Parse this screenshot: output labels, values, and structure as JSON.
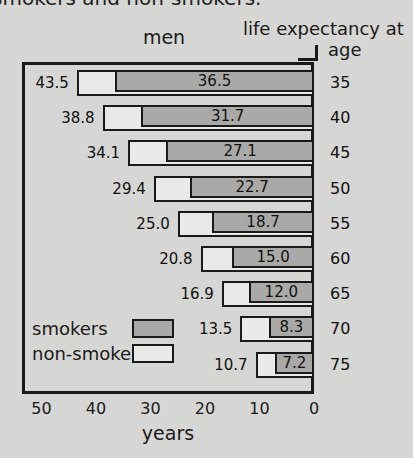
{
  "caption": {
    "text": "smokers and non-smokers."
  },
  "header": {
    "group_label": "men",
    "right_label_line1": "life expectancy at",
    "right_label_line2": "age"
  },
  "legend": {
    "items": [
      {
        "label": "smokers",
        "swatch": "gray",
        "color": "#a9a9a7"
      },
      {
        "label": "non-smokers",
        "swatch": "white",
        "color": "#e9e9e7"
      }
    ]
  },
  "axis": {
    "x_title": "years",
    "x_ticks": [
      "50",
      "40",
      "30",
      "20",
      "10",
      "0"
    ]
  },
  "chart_data": {
    "type": "bar",
    "orientation": "horizontal",
    "title": "men",
    "subtitle": "smokers and non-smokers.",
    "xlabel": "years",
    "ylabel": "life expectancy at age",
    "xlim": [
      50,
      0
    ],
    "x_reversed": true,
    "xticks": [
      50,
      40,
      30,
      20,
      10,
      0
    ],
    "grid": false,
    "legend_position": "inside-bottom-left",
    "categories": [
      "35",
      "40",
      "45",
      "50",
      "55",
      "60",
      "65",
      "70",
      "75"
    ],
    "category_label": "age",
    "series": [
      {
        "name": "non-smokers",
        "color": "#e9e9e7",
        "values": [
          43.5,
          38.8,
          34.1,
          29.4,
          25.0,
          20.8,
          16.9,
          13.5,
          10.7
        ]
      },
      {
        "name": "smokers",
        "color": "#a9a9a7",
        "values": [
          36.5,
          31.7,
          27.1,
          22.7,
          18.7,
          15.0,
          12.0,
          8.3,
          7.2
        ]
      }
    ],
    "rows": [
      {
        "age": "35",
        "non_smokers": "43.5",
        "smokers": "36.5"
      },
      {
        "age": "40",
        "non_smokers": "38.8",
        "smokers": "31.7"
      },
      {
        "age": "45",
        "non_smokers": "34.1",
        "smokers": "27.1"
      },
      {
        "age": "50",
        "non_smokers": "29.4",
        "smokers": "22.7"
      },
      {
        "age": "55",
        "non_smokers": "25.0",
        "smokers": "18.7"
      },
      {
        "age": "60",
        "non_smokers": "20.8",
        "smokers": "15.0"
      },
      {
        "age": "65",
        "non_smokers": "16.9",
        "smokers": "12.0"
      },
      {
        "age": "70",
        "non_smokers": "13.5",
        "smokers": "8.3"
      },
      {
        "age": "75",
        "non_smokers": "10.7",
        "smokers": "7.2"
      }
    ]
  }
}
